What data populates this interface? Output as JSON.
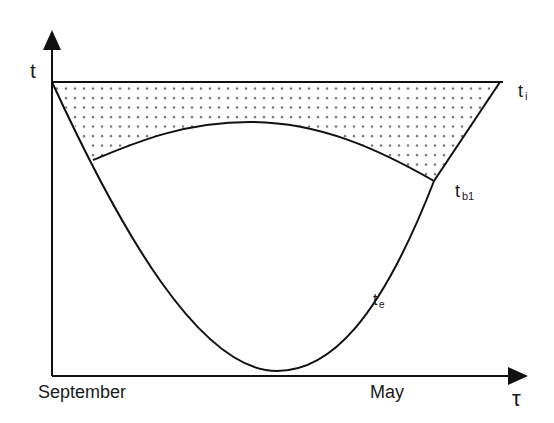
{
  "diagram": {
    "axes": {
      "y_label": "t",
      "x_label": "τ",
      "x_start_label": "September",
      "x_end_label": "May"
    },
    "curves": [
      {
        "name": "t_i",
        "label_main": "t",
        "label_sub": "i",
        "description": "indoor temperature (horizontal line)"
      },
      {
        "name": "t_b1",
        "label_main": "t",
        "label_sub": "b1",
        "description": "balance temperature curve"
      },
      {
        "name": "t_e",
        "label_main": "t",
        "label_sub": "e",
        "description": "outdoor temperature (parabola)"
      }
    ],
    "shaded_region": "dotted area between t_i and t_b1",
    "colors": {
      "line": "#111111",
      "dots": "#6a6a6a",
      "background": "#ffffff"
    }
  }
}
